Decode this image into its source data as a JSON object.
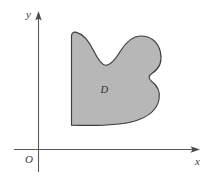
{
  "figure": {
    "type": "math-diagram",
    "background_color": "#ffffff"
  },
  "axes": {
    "origin_label": "O",
    "x_axis_label": "x",
    "y_axis_label": "y",
    "axis_color": "#5a5a5a",
    "arrow_color": "#4a4a4a",
    "x_axis": {
      "start_x": 14,
      "end_x": 200,
      "y": 149.5
    },
    "y_axis": {
      "x": 38.5,
      "start_y": 172,
      "end_y": 11
    },
    "x_arrow_tip": {
      "x": 200,
      "y": 149.5
    },
    "y_arrow_tip": {
      "x": 38.5,
      "y": 11
    },
    "origin_label_pos": {
      "x": 26,
      "y": 163
    },
    "x_label_pos": {
      "x": 195,
      "y": 165
    },
    "y_label_pos": {
      "x": 26,
      "y": 18
    }
  },
  "region": {
    "label": "D",
    "label_pos": {
      "x": 100.5,
      "y": 93
    },
    "fill_color": "#b7b7b7",
    "stroke_color": "#3d3d3d",
    "stroke_width": 1.15,
    "path": "M 71.5 125.2 L 71.5 36.5 C 71.5 33.2 73.0 31.6 76.5 32.4 C 82.5 33.9 88.5 40.5 93.5 50.5 C 98.0 59.6 101.5 64.8 105.5 65.2 C 110.5 65.7 115.0 60.0 120.5 51.0 C 126.5 41.2 133.0 36.2 140.5 36.0 C 150.5 35.8 158.5 42.0 160.5 52.5 C 162.3 61.8 158.5 69.0 152.8 72.8 C 148.5 75.6 147.8 78.5 151.5 81.2 C 157.5 85.6 160.5 92.0 159.0 99.5 C 157.0 109.5 148.0 117.0 135.0 121.0 C 120.0 125.6 100.0 126.0 71.5 125.2 Z"
  }
}
